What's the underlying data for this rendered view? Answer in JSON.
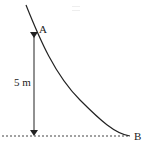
{
  "diagram": {
    "type": "physics-incline-curve",
    "points": {
      "A": {
        "label": "A"
      },
      "B": {
        "label": "B"
      }
    },
    "height_label": "5 m",
    "colors": {
      "stroke": "#222222",
      "dashed": "#444444",
      "background": "#ffffff"
    }
  }
}
